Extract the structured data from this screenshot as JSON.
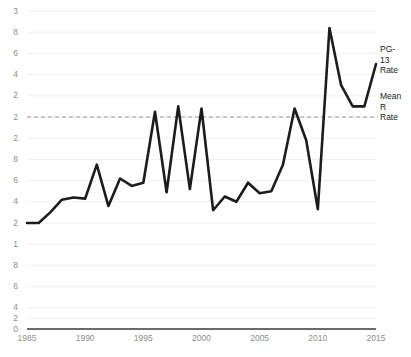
{
  "chart_data": {
    "type": "line",
    "title": "",
    "subtitle": "",
    "xlabel": "",
    "ylabel": "",
    "xlim": [
      1985,
      2015
    ],
    "ylim": [
      0,
      3
    ],
    "grid": true,
    "legend_position": "right-inline",
    "x": [
      1985,
      1986,
      1987,
      1988,
      1989,
      1990,
      1991,
      1992,
      1993,
      1994,
      1995,
      1996,
      1997,
      1998,
      1999,
      2000,
      2001,
      2002,
      2003,
      2004,
      2005,
      2006,
      2007,
      2008,
      2009,
      2010,
      2011,
      2012,
      2013,
      2014,
      2015
    ],
    "series": [
      {
        "name": "PG-13 Rate",
        "style": "solid",
        "color": "#1c1c1c",
        "values": [
          1.0,
          1.0,
          1.1,
          1.22,
          1.24,
          1.23,
          1.55,
          1.16,
          1.42,
          1.35,
          1.38,
          2.05,
          1.29,
          2.1,
          1.32,
          2.08,
          1.12,
          1.25,
          1.2,
          1.38,
          1.28,
          1.3,
          1.55,
          2.08,
          1.78,
          1.13,
          2.84,
          2.3,
          2.1,
          2.1,
          2.5
        ]
      },
      {
        "name": "Mean R Rate",
        "style": "dashed",
        "color": "#8e8e8e",
        "constant_value": 2.0
      }
    ],
    "yticks": [
      {
        "value": 3.0,
        "label": "3"
      },
      {
        "value": 2.8,
        "label": "8"
      },
      {
        "value": 2.6,
        "label": "6"
      },
      {
        "value": 2.4,
        "label": "4"
      },
      {
        "value": 2.2,
        "label": "2"
      },
      {
        "value": 2.0,
        "label": "2"
      },
      {
        "value": 1.8,
        "label": "2"
      },
      {
        "value": 1.6,
        "label": "8"
      },
      {
        "value": 1.4,
        "label": "6"
      },
      {
        "value": 1.2,
        "label": "4"
      },
      {
        "value": 1.0,
        "label": "2"
      },
      {
        "value": 0.8,
        "label": "1"
      },
      {
        "value": 0.6,
        "label": "8"
      },
      {
        "value": 0.4,
        "label": "6"
      },
      {
        "value": 0.2,
        "label": "4"
      },
      {
        "value": 0.1,
        "label": "2"
      },
      {
        "value": 0.0,
        "label": "0"
      }
    ],
    "xticks": [
      {
        "value": 1985,
        "label": "1985"
      },
      {
        "value": 1990,
        "label": "1990"
      },
      {
        "value": 1995,
        "label": "1995"
      },
      {
        "value": 2000,
        "label": "2000"
      },
      {
        "value": 2005,
        "label": "2005"
      },
      {
        "value": 2010,
        "label": "2010"
      },
      {
        "value": 2015,
        "label": "2015"
      }
    ],
    "annotations": [
      {
        "id": "pg13",
        "lines": [
          "PG-",
          "13",
          "Rate"
        ]
      },
      {
        "id": "meanr",
        "lines": [
          "Mean",
          "R",
          "Rate"
        ]
      }
    ],
    "colors": {
      "background": "#ffffff",
      "line": "#1c1c1c",
      "mean_line": "#9a9a9a",
      "grid": "#f0f0f0",
      "axis": "#3a3a3a",
      "tick_text": "#8e8e8e",
      "annotation_text": "#1c1c1c"
    }
  }
}
